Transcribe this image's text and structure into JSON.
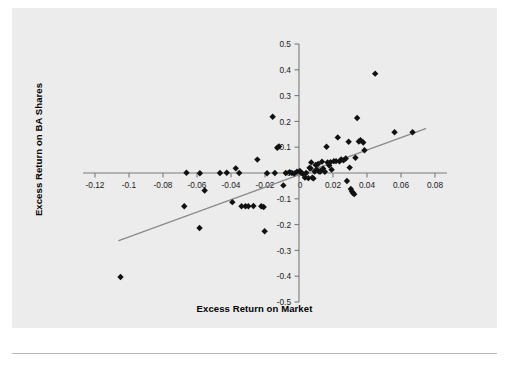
{
  "figure": {
    "background_color": "#ececed",
    "page_color": "#ffffff"
  },
  "chart_data": {
    "type": "scatter",
    "title": "",
    "xlabel": "Excess Return on Market",
    "ylabel": "Excess Return on BA Shares",
    "xlim": [
      -0.13,
      0.085
    ],
    "ylim": [
      -0.5,
      0.5
    ],
    "grid": false,
    "legend": null,
    "marker": {
      "shape": "diamond",
      "color": "#111111",
      "size": 4.2
    },
    "xticks": [
      -0.12,
      -0.1,
      -0.08,
      -0.06,
      -0.04,
      -0.02,
      0,
      0.02,
      0.04,
      0.06,
      0.08
    ],
    "xtick_labels": [
      "-0.12",
      "-0.1",
      "-0.08",
      "-0.06",
      "-0.04",
      "-0.02",
      "0",
      "0.02",
      "0.04",
      "0.06",
      "0.08"
    ],
    "yticks": [
      -0.5,
      -0.4,
      -0.3,
      -0.2,
      -0.1,
      0,
      0.1,
      0.2,
      0.3,
      0.4,
      0.5
    ],
    "ytick_labels": [
      "-0.5",
      "-0.4",
      "-0.3",
      "-0.2",
      "-0.1",
      "0",
      "0.1",
      "0.2",
      "0.3",
      "0.4",
      "0.5"
    ],
    "axis_origin": [
      0,
      0
    ],
    "axis_color": "#7a7a7a",
    "trendline": {
      "type": "linear",
      "color": "#8a8a8a",
      "x_start": -0.106,
      "y_start": -0.262,
      "x_end": 0.0745,
      "y_end": 0.172
    },
    "points": [
      {
        "x": -0.105,
        "y": -0.403
      },
      {
        "x": -0.0675,
        "y": -0.129
      },
      {
        "x": -0.0662,
        "y": 0.001
      },
      {
        "x": -0.0585,
        "y": -0.213
      },
      {
        "x": -0.0583,
        "y": -0.001
      },
      {
        "x": -0.0555,
        "y": -0.068
      },
      {
        "x": -0.0465,
        "y": 0.0
      },
      {
        "x": -0.0425,
        "y": 0.001
      },
      {
        "x": -0.0392,
        "y": -0.113
      },
      {
        "x": -0.0372,
        "y": 0.018
      },
      {
        "x": -0.0352,
        "y": 0.0
      },
      {
        "x": -0.0338,
        "y": -0.129
      },
      {
        "x": -0.0315,
        "y": -0.129
      },
      {
        "x": -0.0298,
        "y": -0.129
      },
      {
        "x": -0.0268,
        "y": -0.128
      },
      {
        "x": -0.0245,
        "y": 0.052
      },
      {
        "x": -0.0222,
        "y": -0.129
      },
      {
        "x": -0.0208,
        "y": -0.132
      },
      {
        "x": -0.0202,
        "y": -0.226
      },
      {
        "x": -0.0188,
        "y": -0.001
      },
      {
        "x": -0.0155,
        "y": 0.218
      },
      {
        "x": -0.0142,
        "y": 0.0
      },
      {
        "x": -0.0128,
        "y": 0.098
      },
      {
        "x": -0.0118,
        "y": 0.103
      },
      {
        "x": -0.0092,
        "y": -0.048
      },
      {
        "x": -0.0078,
        "y": 0.0
      },
      {
        "x": -0.0055,
        "y": 0.003
      },
      {
        "x": -0.0042,
        "y": 0.0
      },
      {
        "x": -0.0028,
        "y": -0.002
      },
      {
        "x": -0.0012,
        "y": 0.005
      },
      {
        "x": 0.0005,
        "y": 0.008
      },
      {
        "x": 0.0012,
        "y": 0.001
      },
      {
        "x": 0.0022,
        "y": -0.003
      },
      {
        "x": 0.0035,
        "y": -0.018
      },
      {
        "x": 0.0042,
        "y": 0.0
      },
      {
        "x": 0.0055,
        "y": -0.02
      },
      {
        "x": 0.0062,
        "y": 0.02
      },
      {
        "x": 0.0068,
        "y": 0.018
      },
      {
        "x": 0.0072,
        "y": 0.041
      },
      {
        "x": 0.0078,
        "y": -0.018
      },
      {
        "x": 0.0085,
        "y": -0.021
      },
      {
        "x": 0.0092,
        "y": 0.006
      },
      {
        "x": 0.0098,
        "y": 0.031
      },
      {
        "x": 0.0105,
        "y": 0.013
      },
      {
        "x": 0.0112,
        "y": 0.035
      },
      {
        "x": 0.0118,
        "y": 0.006
      },
      {
        "x": 0.0125,
        "y": 0.006
      },
      {
        "x": 0.0135,
        "y": 0.044
      },
      {
        "x": 0.0142,
        "y": 0.017
      },
      {
        "x": 0.0152,
        "y": 0.005
      },
      {
        "x": 0.0162,
        "y": 0.102
      },
      {
        "x": 0.0168,
        "y": 0.041
      },
      {
        "x": 0.0178,
        "y": 0.029
      },
      {
        "x": 0.0185,
        "y": 0.042
      },
      {
        "x": 0.0192,
        "y": 0.013
      },
      {
        "x": 0.0205,
        "y": 0.046
      },
      {
        "x": 0.0218,
        "y": 0.046
      },
      {
        "x": 0.0228,
        "y": 0.138
      },
      {
        "x": 0.0238,
        "y": 0.045
      },
      {
        "x": 0.0248,
        "y": 0.053
      },
      {
        "x": 0.0262,
        "y": 0.049
      },
      {
        "x": 0.0275,
        "y": 0.056
      },
      {
        "x": 0.0282,
        "y": -0.031
      },
      {
        "x": 0.0292,
        "y": 0.121
      },
      {
        "x": 0.0298,
        "y": 0.021
      },
      {
        "x": 0.0305,
        "y": -0.062
      },
      {
        "x": 0.0312,
        "y": -0.072
      },
      {
        "x": 0.0318,
        "y": -0.078
      },
      {
        "x": 0.0325,
        "y": -0.082
      },
      {
        "x": 0.0332,
        "y": 0.059
      },
      {
        "x": 0.0342,
        "y": 0.213
      },
      {
        "x": 0.0352,
        "y": 0.122
      },
      {
        "x": 0.0362,
        "y": 0.127
      },
      {
        "x": 0.0378,
        "y": 0.118
      },
      {
        "x": 0.0385,
        "y": 0.088
      },
      {
        "x": 0.0448,
        "y": 0.385
      },
      {
        "x": 0.0562,
        "y": 0.158
      },
      {
        "x": 0.0668,
        "y": 0.158
      }
    ]
  }
}
